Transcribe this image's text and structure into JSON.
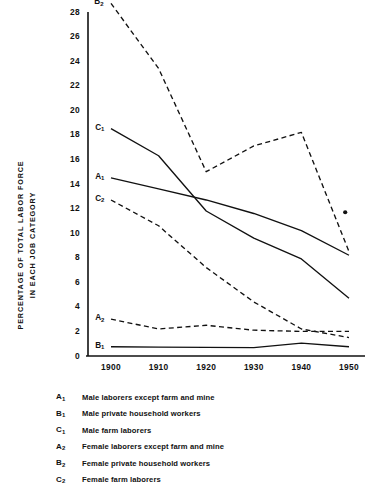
{
  "chart_data": {
    "type": "line",
    "title": "",
    "xlabel": "",
    "ylabel": "PERCENTAGE OF TOTAL LABOR FORCE IN EACH JOB CATEGORY",
    "ylabel_line1": "PERCENTAGE OF TOTAL LABOR FORCE",
    "ylabel_line2": "IN EACH JOB CATEGORY",
    "x": [
      1900,
      1910,
      1920,
      1930,
      1940,
      1950
    ],
    "xtick_labels": [
      "1900",
      "1910",
      "1920",
      "1930",
      "1940",
      "1950"
    ],
    "ytick_labels": [
      "0",
      "2",
      "4",
      "6",
      "8",
      "10",
      "12",
      "14",
      "16",
      "18",
      "20",
      "22",
      "24",
      "26",
      "28"
    ],
    "ytick_values": [
      0,
      2,
      4,
      6,
      8,
      10,
      12,
      14,
      16,
      18,
      20,
      22,
      24,
      26,
      28
    ],
    "xlim": [
      1898,
      1952
    ],
    "ylim": [
      0,
      29
    ],
    "grid": false,
    "legend_position": "below-plot",
    "series": [
      {
        "name": "A1",
        "key": "A₁",
        "label": "Male laborers except farm and mine",
        "style": "solid",
        "values": [
          14.5,
          13.6,
          12.7,
          11.6,
          10.2,
          8.2
        ],
        "label_x": 1899.2,
        "label_y": 14.5
      },
      {
        "name": "B1",
        "key": "B₁",
        "label": "Male private household workers",
        "style": "solid",
        "values": [
          0.75,
          0.72,
          0.7,
          0.68,
          1.05,
          0.75
        ],
        "label_x": 1899.2,
        "label_y": 0.75
      },
      {
        "name": "C1",
        "key": "C₁",
        "label": "Male farm laborers",
        "style": "solid",
        "values": [
          18.5,
          16.3,
          11.8,
          9.6,
          7.9,
          4.7
        ],
        "label_x": 1899.2,
        "label_y": 18.5
      },
      {
        "name": "A2",
        "key": "A₂",
        "label": "Female laborers except farm and mine",
        "style": "dashed",
        "values": [
          3.0,
          2.2,
          2.5,
          2.1,
          2.0,
          2.0
        ],
        "label_x": 1899.2,
        "label_y": 3.0
      },
      {
        "name": "B2",
        "key": "B₂",
        "label": "Female private household workers",
        "style": "dashed",
        "values": [
          28.7,
          23.4,
          15.0,
          17.1,
          18.2,
          8.5
        ],
        "label_x": 1899.0,
        "label_y": 28.7
      },
      {
        "name": "C2",
        "key": "C₂",
        "label": "Female farm laborers",
        "style": "dashed",
        "values": [
          12.7,
          10.6,
          7.2,
          4.4,
          2.2,
          1.5
        ],
        "label_x": 1899.2,
        "label_y": 12.7
      }
    ],
    "annotations": [
      {
        "name": "asterisk-marker",
        "symbol": "•",
        "x": 1949.2,
        "y": 11.7
      }
    ]
  },
  "legend": {
    "rows": [
      {
        "key": "A",
        "sub": "1",
        "desc": "Male laborers except farm and mine"
      },
      {
        "key": "B",
        "sub": "1",
        "desc": "Male private household workers"
      },
      {
        "key": "C",
        "sub": "1",
        "desc": "Male farm laborers"
      },
      {
        "key": "A",
        "sub": "2",
        "desc": "Female laborers except farm and mine"
      },
      {
        "key": "B",
        "sub": "2",
        "desc": "Female private household workers"
      },
      {
        "key": "C",
        "sub": "2",
        "desc": "Female farm laborers"
      }
    ]
  },
  "colors": {
    "ink": "#111111",
    "background": "#ffffff"
  }
}
